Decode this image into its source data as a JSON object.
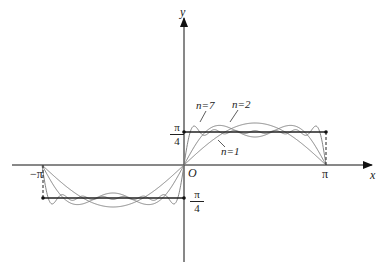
{
  "diagram": {
    "title": "",
    "axes": {
      "x_label": "x",
      "y_label": "y",
      "origin_label": "O"
    },
    "x_ticks": [
      {
        "label": "−π",
        "value": -3.14159
      },
      {
        "label": "π",
        "value": 3.14159
      }
    ],
    "y_ticks": [
      {
        "numerator": "π",
        "denominator": "4",
        "value": 0.7854
      },
      {
        "numerator": "π",
        "denominator": "4",
        "value": -0.7854
      }
    ],
    "curve_labels": [
      "n=7",
      "n=2",
      "n=1"
    ],
    "colors": {
      "axis": "#111111",
      "curve": "#777777",
      "square_wave": "#222222"
    }
  },
  "chart_data": {
    "type": "line",
    "xlabel": "x",
    "ylabel": "y",
    "xlim": [
      -3.14159,
      3.14159
    ],
    "series": [
      {
        "name": "n=1",
        "formula": "sin x"
      },
      {
        "name": "n=2",
        "formula": "sin x + sin 3x/3"
      },
      {
        "name": "n=7",
        "formula": "sum_{k=1}^{7} sin((2k-1)x)/(2k-1)"
      },
      {
        "name": "f(x)",
        "values": "π/4 on (0,π), −π/4 on (−π,0)"
      }
    ]
  }
}
